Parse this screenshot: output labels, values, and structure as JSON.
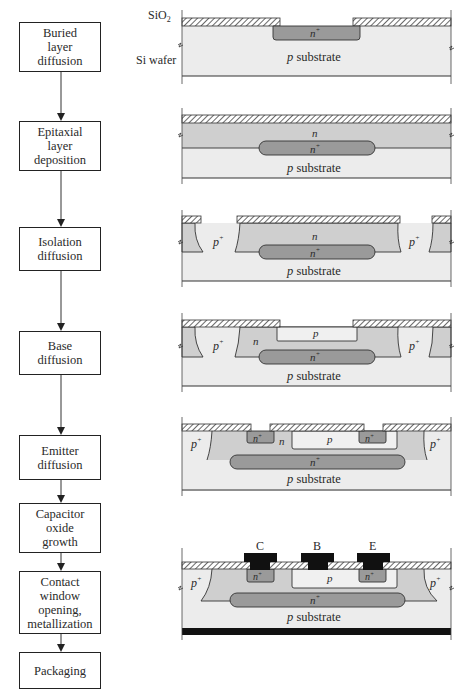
{
  "figure": {
    "steps": [
      {
        "id": "buried",
        "lines": [
          "Buried",
          "layer",
          "diffusion"
        ]
      },
      {
        "id": "epitaxial",
        "lines": [
          "Epitaxial",
          "layer",
          "deposition"
        ]
      },
      {
        "id": "isolation",
        "lines": [
          "Isolation",
          "diffusion"
        ]
      },
      {
        "id": "base",
        "lines": [
          "Base",
          "diffusion"
        ]
      },
      {
        "id": "emitter",
        "lines": [
          "Emitter",
          "diffusion"
        ]
      },
      {
        "id": "capacitor",
        "lines": [
          "Capacitor",
          "oxide",
          "growth"
        ]
      },
      {
        "id": "contact",
        "lines": [
          "Contact",
          "window",
          "opening,",
          "metallization"
        ]
      },
      {
        "id": "packaging",
        "lines": [
          "Packaging"
        ]
      }
    ],
    "side_labels": {
      "oxide": "SiO",
      "oxide_sub": "2",
      "wafer": "Si wafer"
    },
    "region_labels": {
      "substrate": "p substrate",
      "substrate_p": "p",
      "substrate_word": "substrate",
      "n_plus": "n",
      "plus": "+",
      "n": "n",
      "p": "p",
      "p_plus": "p"
    },
    "terminals": [
      "C",
      "B",
      "E"
    ],
    "colors": {
      "oxide_hatch": "#555555",
      "substrate": "#ececec",
      "n_region": "#cfcfcf",
      "n_plus_region": "#9a9a9a",
      "p_region": "#f0f0f0",
      "metal": "#111111",
      "outline": "#333333"
    }
  }
}
